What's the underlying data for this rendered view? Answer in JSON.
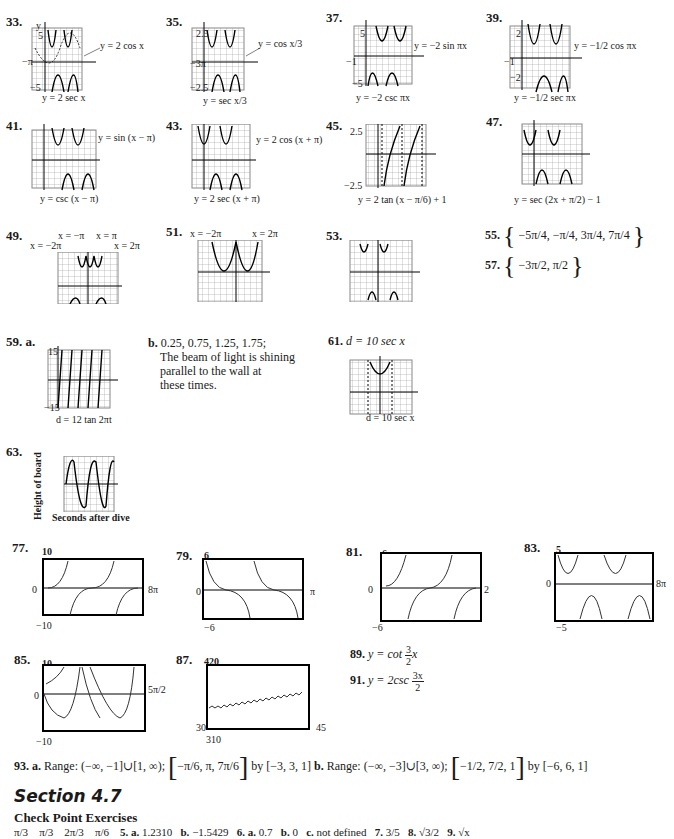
{
  "problems_top": [
    {
      "num": "33.",
      "caption": "y = 2 sec x",
      "label": "y = 2 cos x",
      "ytop": "5",
      "ybot": "−5",
      "xlabels": [
        "−π",
        "2π",
        "4π"
      ]
    },
    {
      "num": "35.",
      "caption": "y = sec x/3",
      "label": "y = cos x/3",
      "ytop": "2.5",
      "ybot": "−2.5",
      "xlabels": [
        "−3π",
        "6π",
        "12π"
      ]
    },
    {
      "num": "37.",
      "caption": "y = −2 csc πx",
      "label": "y = −2 sin πx",
      "ytop": "5",
      "ybot": "−5",
      "xlabels": [
        "−1",
        "3",
        "4"
      ]
    },
    {
      "num": "39.",
      "caption": "y = −1/2 sec πx",
      "label": "y = −1/2 cos πx",
      "ytop": "2",
      "ybot": "−2",
      "xlabels": [
        "−1",
        "1",
        "3",
        "4"
      ]
    },
    {
      "num": "41.",
      "caption": "y = csc (x − π)",
      "label": "y = sin (x − π)",
      "ytop": "2",
      "ybot": "−2",
      "xlabels": [
        "−π",
        "π",
        "2π",
        "3π",
        "4π"
      ]
    },
    {
      "num": "43.",
      "caption": "y = 2 sec (x + π)",
      "label": "y = 2 cos (x + π)",
      "ytop": "",
      "ybot": "",
      "xlabels": [
        "−π",
        "π",
        "2π",
        "3π"
      ]
    },
    {
      "num": "45.",
      "caption": "y = 2 tan (x − π/6) + 1",
      "label": "",
      "ytop": "2.5",
      "ybot": "−2.5",
      "xlabels": [
        "π/2"
      ]
    },
    {
      "num": "47.",
      "caption": "y = sec (2x + π/2) − 1",
      "label": "",
      "ytop": "5",
      "ybot": "−5",
      "xlabels": [
        "−π",
        "2π"
      ]
    },
    {
      "num": "49.",
      "caption": "",
      "label": "",
      "asymptotes": [
        "x = −2π",
        "x = −π",
        "x = π",
        "x = 2π"
      ],
      "ytop": "2",
      "ybot": "−2",
      "xlabels": [
        "−3π",
        "3π"
      ]
    },
    {
      "num": "51.",
      "caption": "",
      "asymptotes": [
        "x = −2π",
        "x = 2π"
      ],
      "xlabels": [
        "−3π",
        "−π",
        "π",
        "3π"
      ]
    },
    {
      "num": "53.",
      "caption": "",
      "xlabels": [
        "−π",
        "−π/2",
        "π/2",
        "π",
        "3π/2"
      ]
    }
  ],
  "answers": {
    "p55": {
      "num": "55.",
      "set": [
        "−5π/4",
        "−π/4",
        "3π/4",
        "7π/4"
      ]
    },
    "p57": {
      "num": "57.",
      "set": [
        "−3π/2",
        "π/2"
      ]
    },
    "p59": {
      "num": "59.",
      "part_a": "a.",
      "caption_a": "d = 12 tan 2πt",
      "ytop": "15",
      "ybot": "−15",
      "xlabel": "2",
      "axis_t": "t",
      "axis_d": "d",
      "part_b": "b.",
      "b_line1": "0.25, 0.75, 1.25, 1.75;",
      "b_line2": "The beam of light is shining",
      "b_line3": "parallel to the wall at",
      "b_line4": "these times."
    },
    "p61": {
      "num": "61.",
      "eq": "d = 10 sec x",
      "caption": "d = 10 sec x",
      "ytop": "15",
      "xleft": "−π",
      "xright": "π"
    },
    "p63": {
      "num": "63.",
      "ylabel": "Height of board",
      "xlabel": "Seconds after dive",
      "ytop": "10",
      "ybot": "−10",
      "xright": "2.5"
    }
  },
  "calculator_graphs": [
    {
      "num": "77.",
      "ymax": "10",
      "ymin": "−10",
      "xzero": "0",
      "xmax": "8π"
    },
    {
      "num": "79.",
      "ymax": "6",
      "ymin": "−6",
      "xzero": "0",
      "xmax": "π"
    },
    {
      "num": "81.",
      "ymax": "6",
      "ymin": "−6",
      "xzero": "0",
      "xmax": "2"
    },
    {
      "num": "83.",
      "ymax": "5",
      "ymin": "−5",
      "xzero": "0",
      "xmax": "8π"
    },
    {
      "num": "85.",
      "ymax": "10",
      "ymin": "−10",
      "xzero": "0",
      "xmax": "5π/2"
    },
    {
      "num": "87.",
      "ymax": "420",
      "ymin": "310",
      "xmin": "30",
      "xmax": "45"
    }
  ],
  "p89": {
    "num": "89.",
    "text": "y = cot",
    "frac_n": "3",
    "frac_d": "2",
    "tail": "x"
  },
  "p91": {
    "num": "91.",
    "text": "y = 2csc",
    "frac_n": "3x",
    "frac_d": "2"
  },
  "p93": {
    "num": "93.",
    "a_label": "a.",
    "a_range": "Range: (−∞, −1]∪[1, ∞);",
    "a_window_inner": "−π/6, π, 7π/6",
    "a_by": "by [−3, 3, 1]",
    "b_label": "b.",
    "b_range": "Range: (−∞, −3]∪[3, ∞);",
    "b_window_inner": "−1/2, 7/2, 1",
    "b_by": "by [−6, 6, 1]"
  },
  "section": {
    "title": "Section 4.7",
    "subtitle": "Check Point Exercises"
  },
  "checkpoint_line": [
    {
      "num": "",
      "val": "π/3"
    },
    {
      "num": "",
      "val": "π/3"
    },
    {
      "num": "",
      "val": "2π/3"
    },
    {
      "num": "",
      "val": "π/6"
    },
    {
      "num": "5. a.",
      "val": "1.2310"
    },
    {
      "num": "b.",
      "val": "−1.5429"
    },
    {
      "num": "6. a.",
      "val": "0.7"
    },
    {
      "num": "b.",
      "val": "0"
    },
    {
      "num": "c.",
      "val": "not defined"
    },
    {
      "num": "7.",
      "val": "3/5"
    },
    {
      "num": "8.",
      "val": "√3/2"
    },
    {
      "num": "9.",
      "val": "√x"
    }
  ]
}
